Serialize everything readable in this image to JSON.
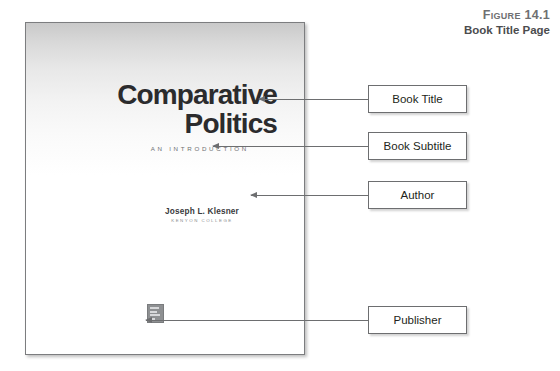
{
  "figure": {
    "label": "Figure 14.1",
    "title": "Book Title Page"
  },
  "book_page": {
    "title_line_1": "Comparative",
    "title_line_2": "Politics",
    "subtitle": "AN INTRODUCTION",
    "author_name": "Joseph L. Klesner",
    "author_affiliation": "KENYON COLLEGE",
    "publisher_logo_alt": "publisher-logo"
  },
  "callouts": [
    {
      "label": "Book Title"
    },
    {
      "label": "Book Subtitle"
    },
    {
      "label": "Author"
    },
    {
      "label": "Publisher"
    }
  ],
  "colors": {
    "caption_label": "#6e6f71",
    "caption_title": "#4b4c4e",
    "title_text": "#2b2b2d",
    "subtitle_text": "#6f7073",
    "author_text": "#3a3a3c",
    "affiliation_text": "#8a8b8d",
    "box_border": "#6d6e70",
    "leader_line": "#6d6e70",
    "page_border": "#7c7d7f",
    "logo_fill": "#8e9092"
  }
}
